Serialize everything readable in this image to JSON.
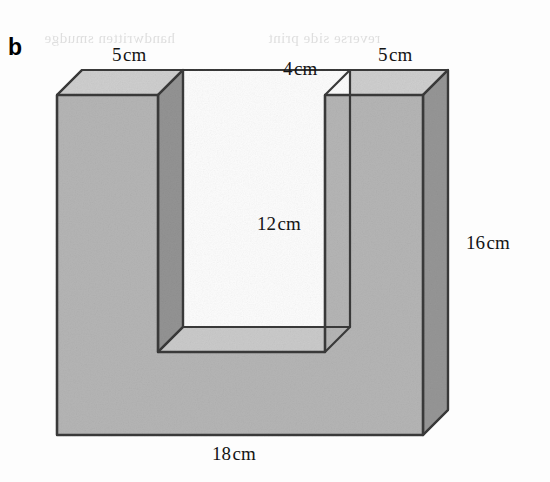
{
  "figure": {
    "part_letter": "b",
    "shape_name": "u-shaped-prism",
    "projection": "oblique",
    "labels": {
      "top_left_width": {
        "value": "5",
        "unit": "cm"
      },
      "gap_width": {
        "value": "4",
        "unit": "cm"
      },
      "top_right_width": {
        "value": "5",
        "unit": "cm"
      },
      "slot_depth": {
        "value": "12",
        "unit": "cm"
      },
      "total_height": {
        "value": "16",
        "unit": "cm"
      },
      "total_width": {
        "value": "18",
        "unit": "cm"
      }
    },
    "colors": {
      "front_face": "#b6b6b6",
      "top_face": "#cfcfcf",
      "side_face": "#979797",
      "slot_floor": "#cbcbcb",
      "slot_inner_wall": "#949494",
      "slot_back": "#fdfdfd",
      "outline": "#3a3a3a",
      "label_text": "#151515",
      "background": "#fefefe"
    }
  },
  "artifacts": {
    "bleed_top_left": "handwritten smudge",
    "bleed_top_right": "reverse side print",
    "bleed_mid": "faint marks",
    "bleed_low": "faint marks"
  }
}
